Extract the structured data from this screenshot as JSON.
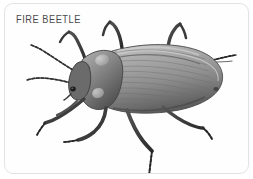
{
  "card": {
    "label": "FIRE BEETLE",
    "border_color": "#e3e3e5",
    "background_color": "#fefefe",
    "corner_radius_px": 9,
    "label_color": "#4a4a4c"
  },
  "illustration": {
    "subject": "fire-beetle",
    "style": "grayscale-photographic-illustration",
    "orientation": "head-lower-left-abdomen-upper-right",
    "body_color_light": "#b4b4b4",
    "body_color_mid": "#8d8d8d",
    "body_color_dark": "#4f4f4f",
    "leg_color": "#3a3a3a",
    "antenna_color": "#555555",
    "parts": [
      "left-antenna",
      "right-antenna",
      "head",
      "eye",
      "pronotum",
      "elytra",
      "elytra-striations",
      "front-left-leg",
      "front-right-leg",
      "middle-left-leg",
      "middle-right-leg",
      "hind-left-leg",
      "hind-right-leg"
    ]
  }
}
